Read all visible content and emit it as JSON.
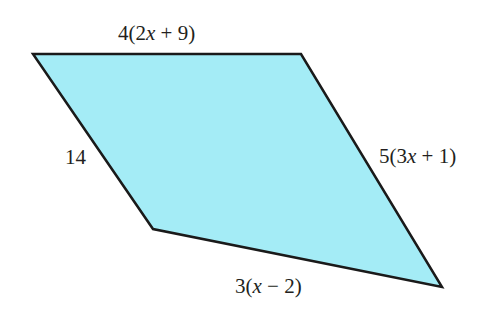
{
  "diagram": {
    "type": "quadrilateral",
    "fill_color": "#a4ecf6",
    "stroke_color": "#1a1a1a",
    "vertices": [
      [
        33,
        54
      ],
      [
        301,
        54
      ],
      [
        442,
        287
      ],
      [
        153,
        229
      ]
    ],
    "sides": {
      "top": {
        "prefix": "4(2",
        "var": "x",
        "suffix": " + 9)"
      },
      "right": {
        "prefix": "5(3",
        "var": "x",
        "suffix": " + 1)"
      },
      "bottom": {
        "prefix": "3(",
        "var": "x",
        "suffix": " − 2)"
      },
      "left": {
        "text": "14"
      }
    }
  }
}
